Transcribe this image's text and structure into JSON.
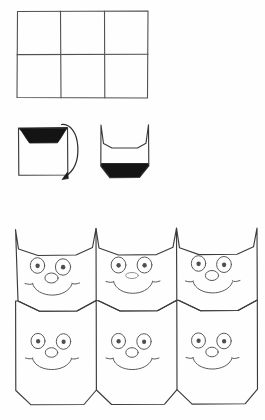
{
  "page": {
    "width": 265,
    "height": 420,
    "background_color": "#fefefe",
    "ink_color": "#3b3b3b",
    "fill_color": "#141414"
  },
  "steps": [
    {
      "id": "step-grid",
      "name": "grid-panel",
      "label": "",
      "shape": "rectangle-grid",
      "columns": 3,
      "rows": 2,
      "bounds": {
        "x": 17,
        "y": 11,
        "width": 131,
        "height": 87
      }
    },
    {
      "id": "step-fold",
      "name": "fold-panel",
      "label": "",
      "shape": "square-with-shaded-top-band",
      "bounds": {
        "x": 18,
        "y": 127,
        "width": 50,
        "height": 48
      },
      "shading": "top-trapezoid-dark"
    },
    {
      "id": "step-arrow",
      "name": "fold-arrow",
      "label": "",
      "shape": "curved-arrow-clockwise",
      "direction": "down",
      "bounds": {
        "x": 60,
        "y": 122,
        "width": 18,
        "height": 58
      }
    },
    {
      "id": "step-result",
      "name": "cat-head-panel",
      "label": "",
      "shape": "cat-head-with-shaded-bottom-band",
      "bounds": {
        "x": 100,
        "y": 124,
        "width": 50,
        "height": 54
      },
      "shading": "bottom-trapezoid-dark",
      "ears": 2
    },
    {
      "id": "step-sheet",
      "name": "cat-sheet-panel",
      "label": "",
      "shape": "six-cat-faces-grid",
      "columns": 3,
      "rows": 2,
      "count": 6,
      "bounds": {
        "x": 15,
        "y": 228,
        "width": 242,
        "height": 177
      }
    }
  ],
  "cat_faces": [
    {
      "index": 1,
      "name": "cat-face-top-left",
      "row": 1,
      "col": 1,
      "nose": "round-oval",
      "eyes": 2,
      "whiskers": 2,
      "mouth": "smile"
    },
    {
      "index": 2,
      "name": "cat-face-top-center",
      "row": 1,
      "col": 2,
      "nose": "flat-oval",
      "eyes": 2,
      "whiskers": 2,
      "mouth": "smile"
    },
    {
      "index": 3,
      "name": "cat-face-top-right",
      "row": 1,
      "col": 3,
      "nose": "round-oval",
      "eyes": 2,
      "whiskers": 2,
      "mouth": "smile"
    },
    {
      "index": 4,
      "name": "cat-face-bottom-left",
      "row": 2,
      "col": 1,
      "nose": "round-oval",
      "eyes": 2,
      "whiskers": 2,
      "mouth": "smile"
    },
    {
      "index": 5,
      "name": "cat-face-bottom-center",
      "row": 2,
      "col": 2,
      "nose": "round-oval",
      "eyes": 2,
      "whiskers": 2,
      "mouth": "smile"
    },
    {
      "index": 6,
      "name": "cat-face-bottom-right",
      "row": 2,
      "col": 3,
      "nose": "round-oval",
      "eyes": 2,
      "whiskers": 2,
      "mouth": "smile"
    }
  ]
}
